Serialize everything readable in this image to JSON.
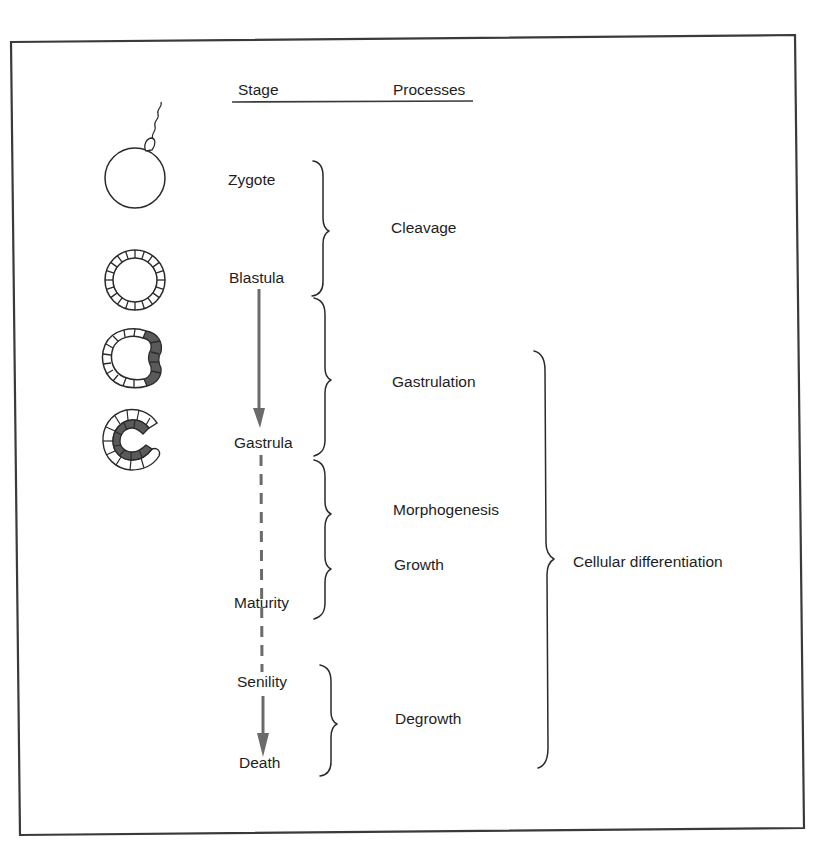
{
  "header": {
    "stage_label": "Stage",
    "processes_label": "Processes"
  },
  "stages": [
    {
      "id": "zygote",
      "label": "Zygote",
      "illustration": "zygote-with-sperm"
    },
    {
      "id": "blastula",
      "label": "Blastula",
      "illustration": "hollow-ball-of-cells"
    },
    {
      "id": "gastrula",
      "label": "Gastrula",
      "illustration": "invaginated-c-shaped-embryo"
    },
    {
      "id": "maturity",
      "label": "Maturity"
    },
    {
      "id": "senility",
      "label": "Senility"
    },
    {
      "id": "death",
      "label": "Death"
    }
  ],
  "processes": [
    {
      "id": "cleavage",
      "label": "Cleavage",
      "spans": [
        "Zygote",
        "Blastula"
      ]
    },
    {
      "id": "gastrulation",
      "label": "Gastrulation",
      "spans": [
        "Blastula",
        "Gastrula"
      ]
    },
    {
      "id": "morphogenesis",
      "label": "Morphogenesis",
      "spans": [
        "Gastrula",
        "Maturity"
      ]
    },
    {
      "id": "growth",
      "label": "Growth",
      "spans": [
        "Gastrula",
        "Maturity"
      ]
    },
    {
      "id": "degrowth",
      "label": "Degrowth",
      "spans": [
        "Senility",
        "Death"
      ]
    }
  ],
  "overarching_process": {
    "label": "Cellular differentiation",
    "spans": [
      "Gastrulation",
      "Degrowth"
    ]
  },
  "connectors": [
    {
      "from": "Blastula",
      "to": "Gastrula",
      "style": "solid-arrow"
    },
    {
      "from": "Gastrula",
      "to": "Senility",
      "style": "dashed"
    },
    {
      "from": "Senility",
      "to": "Death",
      "style": "solid-arrow"
    }
  ],
  "colors": {
    "ink": "#1e1e1e",
    "arrow": "#6b6b6b",
    "cell_shading": "#5a5a5a",
    "frame": "#3a3a3a",
    "background": "#ffffff"
  }
}
